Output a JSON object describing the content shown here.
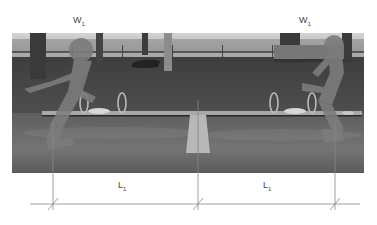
{
  "figure": {
    "type": "annotated-photo"
  },
  "labels": {
    "weight_left": {
      "main": "W",
      "sub": "1"
    },
    "weight_right": {
      "main": "W",
      "sub": "1"
    },
    "length_left": {
      "main": "L",
      "sub": "1"
    },
    "length_right": {
      "main": "L",
      "sub": "1"
    }
  },
  "colors": {
    "background": "#ffffff",
    "photo_sky": "#d8d8d8",
    "photo_grass": "#4a4a4a",
    "photo_ground": "#6a6a6a",
    "silhouette": "#7a7a7a",
    "seesaw_beam": "#b0b0b0",
    "dimension_line": "#888888"
  }
}
